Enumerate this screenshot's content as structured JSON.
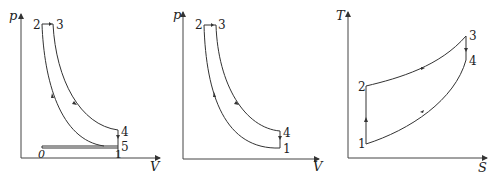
{
  "diagrams": [
    {
      "id": "pv-with-intake",
      "y_axis_label": "p",
      "x_axis_label": "V",
      "points": {
        "p0": "0",
        "p1": "1",
        "p2": "2",
        "p3": "3",
        "p4": "4",
        "p5": "5"
      }
    },
    {
      "id": "pv-cycle",
      "y_axis_label": "p",
      "x_axis_label": "V",
      "points": {
        "p1": "1",
        "p2": "2",
        "p3": "3",
        "p4": "4"
      }
    },
    {
      "id": "ts-cycle",
      "y_axis_label": "T",
      "x_axis_label": "S",
      "points": {
        "p1": "1",
        "p2": "2",
        "p3": "3",
        "p4": "4"
      }
    }
  ],
  "colors": {
    "line": "#333333",
    "axis": "#444444",
    "background": "#ffffff"
  }
}
